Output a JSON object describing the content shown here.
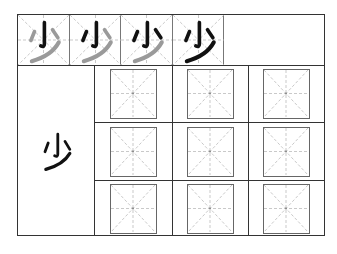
{
  "worksheet": {
    "character": "少",
    "stroke_order_steps": 4,
    "stroke_order": [
      {
        "step": 1,
        "label": "少",
        "black_strokes": [
          "竖钩"
        ],
        "gray_strokes": [
          "点",
          "点",
          "撇"
        ]
      },
      {
        "step": 2,
        "label": "少",
        "black_strokes": [
          "竖钩",
          "点"
        ],
        "gray_strokes": [
          "点",
          "撇"
        ]
      },
      {
        "step": 3,
        "label": "少",
        "black_strokes": [
          "竖钩",
          "点",
          "点"
        ],
        "gray_strokes": [
          "撇"
        ]
      },
      {
        "step": 4,
        "label": "少",
        "black_strokes": [
          "竖钩",
          "点",
          "点",
          "撇"
        ],
        "gray_strokes": []
      }
    ],
    "model_character": "少",
    "practice_grid": {
      "rows": 3,
      "cols": 3,
      "guide": "mi-grid"
    },
    "colors": {
      "ink": "#111111",
      "ghost": "#9a9a9a",
      "border": "#333333",
      "guide": "#bbbbbb"
    }
  }
}
